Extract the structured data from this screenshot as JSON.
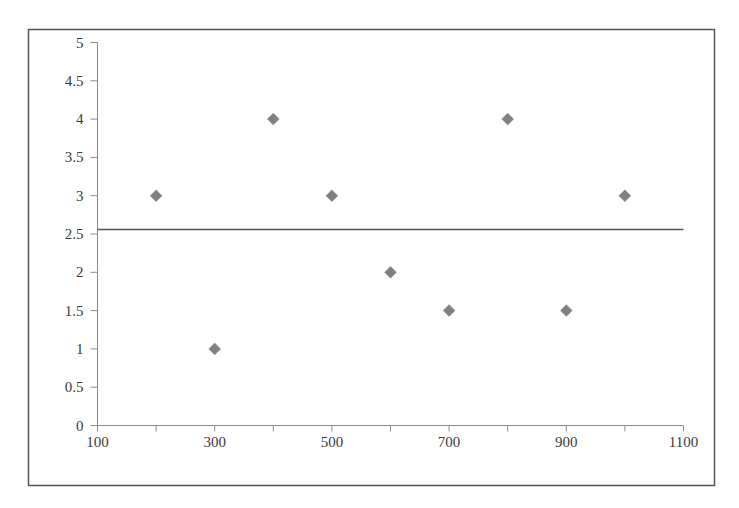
{
  "chart_data": {
    "type": "scatter",
    "title": "",
    "xlabel": "",
    "ylabel": "",
    "xlim": [
      100,
      1100
    ],
    "ylim": [
      0,
      5
    ],
    "x_ticks": [
      100,
      300,
      500,
      700,
      900,
      1100
    ],
    "x_minor_ticks": [
      200,
      400,
      600,
      800,
      1000
    ],
    "y_ticks": [
      0,
      0.5,
      1,
      1.5,
      2,
      2.5,
      3,
      3.5,
      4,
      4.5,
      5
    ],
    "grid": false,
    "legend": null,
    "series": [
      {
        "name": "points",
        "marker": "diamond",
        "color": "#808080",
        "x": [
          200,
          300,
          400,
          500,
          600,
          700,
          800,
          900,
          1000
        ],
        "y": [
          3,
          1,
          4,
          3,
          2,
          1.5,
          4,
          1.5,
          3
        ]
      }
    ],
    "reference_line": {
      "orientation": "horizontal",
      "y": 2.56,
      "color": "#555555"
    }
  },
  "colors": {
    "axis": "#8a8a8a",
    "border": "#555555",
    "marker": "#808080",
    "text": "#3a3a3a"
  }
}
